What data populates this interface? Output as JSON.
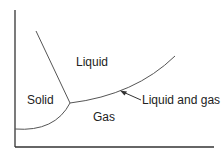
{
  "diagram": {
    "type": "phase-diagram",
    "regions": {
      "solid": "Solid",
      "liquid": "Liquid",
      "gas": "Gas"
    },
    "annotation": "Liquid and gas",
    "colors": {
      "line": "#555555",
      "axis": "#333333",
      "text": "#222222"
    }
  }
}
